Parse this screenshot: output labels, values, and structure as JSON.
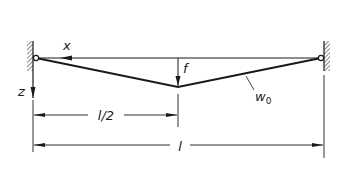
{
  "diagram": {
    "type": "simply-supported beam with initial deflection",
    "labels": {
      "x_axis": "x",
      "z_axis": "z",
      "deflection": "f",
      "initial_shape": "w",
      "initial_shape_sub": "0",
      "half_span": "l/2",
      "span": "l"
    },
    "colors": {
      "ink": "#1a1a1a",
      "background": "#ffffff"
    }
  }
}
